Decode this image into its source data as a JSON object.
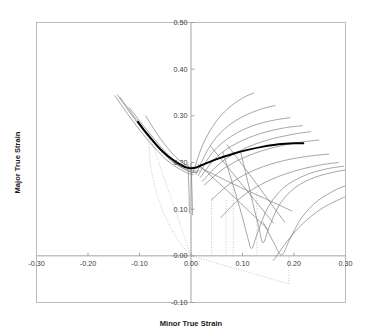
{
  "figure": {
    "title": "",
    "x_axis_title": "Minor True Strain",
    "y_axis_title": "Major True Strain"
  },
  "chart_data": {
    "type": "line",
    "title": "",
    "xlabel": "Minor True Strain",
    "ylabel": "Major True Strain",
    "xlim": [
      -0.3,
      0.3
    ],
    "ylim": [
      -0.1,
      0.5
    ],
    "xticks": [
      -0.3,
      -0.2,
      -0.1,
      0.0,
      0.1,
      0.2,
      0.3
    ],
    "xticklabels": [
      "-0.30",
      "-0.20",
      "-0.10",
      "0.00",
      "0.10",
      "0.20",
      "0.30"
    ],
    "yticks": [
      -0.1,
      0.0,
      0.1,
      0.2,
      0.3,
      0.4,
      0.5
    ],
    "yticklabels": [
      "-0.10",
      "0.00",
      "0.10",
      "0.20",
      "0.30",
      "0.40",
      "0.50"
    ],
    "grid": false,
    "legend": "none",
    "colors": {
      "forming_limit_curve": "#000000",
      "strain_path": "#808080",
      "construction_line": "#b0b0b0",
      "axis": "#9a9a9a",
      "frame": "#b5b5b5"
    },
    "series": [
      {
        "name": "Forming Limit Curve (FLC)",
        "style": "bold-solid-black",
        "points": [
          [
            -0.103,
            0.287
          ],
          [
            -0.09,
            0.268
          ],
          [
            -0.075,
            0.248
          ],
          [
            -0.06,
            0.229
          ],
          [
            -0.045,
            0.214
          ],
          [
            -0.03,
            0.202
          ],
          [
            -0.018,
            0.194
          ],
          [
            -0.008,
            0.189
          ],
          [
            0.005,
            0.188
          ],
          [
            0.02,
            0.194
          ],
          [
            0.04,
            0.203
          ],
          [
            0.06,
            0.211
          ],
          [
            0.085,
            0.22
          ],
          [
            0.11,
            0.227
          ],
          [
            0.14,
            0.234
          ],
          [
            0.17,
            0.239
          ],
          [
            0.2,
            0.241
          ],
          [
            0.218,
            0.241
          ]
        ]
      },
      {
        "name": "Left strain path 1",
        "style": "thin-gray",
        "points": [
          [
            -0.148,
            0.343
          ],
          [
            -0.1,
            0.27
          ],
          [
            -0.05,
            0.208
          ],
          [
            -0.012,
            0.18
          ],
          [
            0.004,
            0.174
          ]
        ]
      },
      {
        "name": "Left strain path 2",
        "style": "thin-gray",
        "points": [
          [
            -0.143,
            0.345
          ],
          [
            -0.095,
            0.272
          ],
          [
            -0.045,
            0.21
          ],
          [
            -0.008,
            0.183
          ],
          [
            0.008,
            0.178
          ]
        ]
      },
      {
        "name": "Left strain path 3",
        "style": "thin-gray",
        "points": [
          [
            -0.138,
            0.34
          ],
          [
            -0.088,
            0.266
          ],
          [
            -0.04,
            0.207
          ],
          [
            -0.004,
            0.182
          ],
          [
            0.012,
            0.179
          ]
        ]
      },
      {
        "name": "Left strain path 4",
        "style": "thin-gray",
        "points": [
          [
            -0.12,
            0.318
          ],
          [
            -0.08,
            0.262
          ],
          [
            -0.035,
            0.206
          ],
          [
            0.0,
            0.184
          ],
          [
            0.016,
            0.182
          ]
        ]
      },
      {
        "name": "Left strain path 5 short",
        "style": "thin-gray",
        "points": [
          [
            -0.088,
            0.3
          ],
          [
            -0.06,
            0.252
          ],
          [
            -0.03,
            0.212
          ],
          [
            -0.004,
            0.191
          ],
          [
            0.014,
            0.188
          ]
        ]
      },
      {
        "name": "Left descending segment 1",
        "style": "thin-gray",
        "points": [
          [
            -0.006,
            0.196
          ],
          [
            -0.004,
            0.14
          ],
          [
            -0.003,
            0.092
          ]
        ]
      },
      {
        "name": "Left descending segment 2",
        "style": "thin-gray",
        "points": [
          [
            0.0,
            0.198
          ],
          [
            0.002,
            0.135
          ],
          [
            0.003,
            0.088
          ]
        ]
      },
      {
        "name": "Right curved strain path 1",
        "style": "thin-gray",
        "points": [
          [
            0.004,
            0.178
          ],
          [
            0.022,
            0.236
          ],
          [
            0.045,
            0.282
          ],
          [
            0.072,
            0.316
          ],
          [
            0.1,
            0.338
          ],
          [
            0.122,
            0.349
          ]
        ]
      },
      {
        "name": "Right curved strain path 2",
        "style": "thin-gray",
        "points": [
          [
            0.01,
            0.175
          ],
          [
            0.035,
            0.232
          ],
          [
            0.065,
            0.272
          ],
          [
            0.1,
            0.298
          ],
          [
            0.135,
            0.314
          ],
          [
            0.163,
            0.322
          ]
        ]
      },
      {
        "name": "Right curved strain path 3",
        "style": "thin-gray",
        "points": [
          [
            0.014,
            0.172
          ],
          [
            0.042,
            0.222
          ],
          [
            0.078,
            0.256
          ],
          [
            0.118,
            0.278
          ],
          [
            0.158,
            0.29
          ],
          [
            0.192,
            0.296
          ]
        ]
      },
      {
        "name": "Right curved strain path 4",
        "style": "thin-gray",
        "points": [
          [
            0.018,
            0.168
          ],
          [
            0.05,
            0.212
          ],
          [
            0.09,
            0.242
          ],
          [
            0.135,
            0.262
          ],
          [
            0.18,
            0.274
          ],
          [
            0.216,
            0.279
          ]
        ]
      },
      {
        "name": "Right curved strain path 5",
        "style": "thin-gray",
        "points": [
          [
            0.022,
            0.16
          ],
          [
            0.058,
            0.2
          ],
          [
            0.1,
            0.228
          ],
          [
            0.148,
            0.248
          ],
          [
            0.196,
            0.26
          ],
          [
            0.232,
            0.266
          ]
        ]
      },
      {
        "name": "Right curved strain path 6",
        "style": "thin-gray",
        "points": [
          [
            0.026,
            0.152
          ],
          [
            0.065,
            0.188
          ],
          [
            0.11,
            0.214
          ],
          [
            0.16,
            0.232
          ],
          [
            0.21,
            0.243
          ],
          [
            0.248,
            0.248
          ]
        ]
      },
      {
        "name": "Right curved strain path 7",
        "style": "thin-gray",
        "points": [
          [
            0.04,
            0.12
          ],
          [
            0.08,
            0.158
          ],
          [
            0.128,
            0.186
          ],
          [
            0.18,
            0.204
          ],
          [
            0.232,
            0.214
          ],
          [
            0.268,
            0.218
          ]
        ]
      },
      {
        "name": "Right curved strain path 8",
        "style": "thin-gray",
        "points": [
          [
            0.058,
            0.082
          ],
          [
            0.098,
            0.126
          ],
          [
            0.145,
            0.158
          ],
          [
            0.196,
            0.18
          ],
          [
            0.248,
            0.194
          ],
          [
            0.286,
            0.2
          ]
        ]
      },
      {
        "name": "Right V-path 1",
        "style": "thin-gray",
        "points": [
          [
            0.062,
            0.222
          ],
          [
            0.082,
            0.15
          ],
          [
            0.098,
            0.09
          ],
          [
            0.11,
            0.04
          ],
          [
            0.118,
            0.016
          ],
          [
            0.13,
            0.052
          ],
          [
            0.15,
            0.105
          ],
          [
            0.18,
            0.146
          ],
          [
            0.22,
            0.172
          ],
          [
            0.262,
            0.186
          ],
          [
            0.296,
            0.192
          ]
        ]
      },
      {
        "name": "Right V-path 2",
        "style": "thin-gray",
        "points": [
          [
            0.096,
            0.224
          ],
          [
            0.11,
            0.16
          ],
          [
            0.122,
            0.104
          ],
          [
            0.132,
            0.06
          ],
          [
            0.14,
            0.028
          ],
          [
            0.152,
            0.062
          ],
          [
            0.172,
            0.11
          ],
          [
            0.202,
            0.146
          ],
          [
            0.24,
            0.168
          ],
          [
            0.28,
            0.18
          ],
          [
            0.3,
            0.184
          ]
        ]
      },
      {
        "name": "Right V-path 3",
        "style": "thin-gray",
        "points": [
          [
            0.14,
            0.072
          ],
          [
            0.16,
            0.03
          ],
          [
            0.176,
            0.002
          ],
          [
            0.192,
            0.036
          ],
          [
            0.215,
            0.082
          ],
          [
            0.246,
            0.118
          ],
          [
            0.282,
            0.142
          ],
          [
            0.3,
            0.15
          ]
        ]
      },
      {
        "name": "Right lower path 4",
        "style": "thin-gray",
        "points": [
          [
            0.16,
            -0.01
          ],
          [
            0.186,
            0.03
          ],
          [
            0.216,
            0.068
          ],
          [
            0.252,
            0.1
          ],
          [
            0.29,
            0.122
          ],
          [
            0.3,
            0.126
          ]
        ]
      },
      {
        "name": "Right straight ray 1",
        "style": "thin-gray",
        "points": [
          [
            0.038,
            0.235
          ],
          [
            0.09,
            0.165
          ],
          [
            0.132,
            0.108
          ],
          [
            0.16,
            0.07
          ]
        ]
      },
      {
        "name": "Right straight ray 2",
        "style": "thin-gray",
        "points": [
          [
            0.07,
            0.238
          ],
          [
            0.11,
            0.18
          ],
          [
            0.15,
            0.12
          ],
          [
            0.182,
            0.072
          ]
        ]
      },
      {
        "name": "Right straight ray 3",
        "style": "thin-gray",
        "points": [
          [
            0.014,
            0.196
          ],
          [
            0.07,
            0.14
          ],
          [
            0.118,
            0.09
          ],
          [
            0.15,
            0.056
          ]
        ]
      },
      {
        "name": "Right straight ray 4",
        "style": "thin-gray",
        "points": [
          [
            0.016,
            0.19
          ],
          [
            0.08,
            0.155
          ],
          [
            0.145,
            0.122
          ],
          [
            0.196,
            0.096
          ]
        ]
      }
    ],
    "construction_lines": [
      {
        "name": "origin ray up-left",
        "style": "dotted",
        "points": [
          [
            0.0,
            0.0
          ],
          [
            -0.082,
            0.262
          ]
        ]
      },
      {
        "name": "origin ray up-left outer",
        "style": "dotted",
        "points": [
          [
            -0.082,
            0.262
          ],
          [
            -0.078,
            0.19
          ],
          [
            -0.06,
            0.112
          ],
          [
            -0.03,
            0.042
          ],
          [
            0.0,
            0.0
          ]
        ]
      },
      {
        "name": "origin ray down-right",
        "style": "dotted",
        "points": [
          [
            0.0,
            0.0
          ],
          [
            0.19,
            -0.06
          ]
        ]
      },
      {
        "name": "riser at 0.19",
        "style": "dotted",
        "points": [
          [
            0.19,
            -0.06
          ],
          [
            0.19,
            0.0
          ]
        ]
      },
      {
        "name": "vertical projection at 0.00",
        "style": "dotted",
        "points": [
          [
            0.0,
            0.0
          ],
          [
            0.0,
            0.196
          ]
        ]
      },
      {
        "name": "vertical projection at 0.040",
        "style": "dotted",
        "points": [
          [
            0.04,
            0.0
          ],
          [
            0.04,
            0.128
          ]
        ]
      },
      {
        "name": "vertical projection at 0.068",
        "style": "dotted",
        "points": [
          [
            0.068,
            0.0
          ],
          [
            0.068,
            0.12
          ]
        ]
      },
      {
        "name": "vertical projection at 0.082",
        "style": "dotted",
        "points": [
          [
            0.082,
            0.0
          ],
          [
            0.082,
            0.146
          ]
        ]
      },
      {
        "name": "vertical projection at 0.128",
        "style": "dotted",
        "points": [
          [
            0.128,
            0.0
          ],
          [
            0.128,
            0.138
          ]
        ]
      }
    ]
  }
}
